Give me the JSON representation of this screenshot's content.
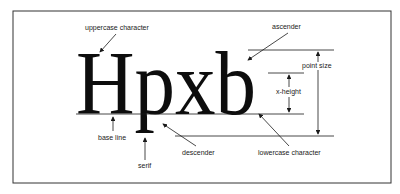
{
  "figure": {
    "sample_text": "Hpxb",
    "labels": {
      "uppercase_character": "uppercase character",
      "ascender": "ascender",
      "point_size": "point size",
      "x_height": "x-height",
      "base_line": "base line",
      "serif": "serif",
      "descender": "descender",
      "lowercase_character": "lowercase character"
    },
    "colors": {
      "ink": "#1a1a1a",
      "background": "#ffffff",
      "frame": "#333333"
    }
  }
}
